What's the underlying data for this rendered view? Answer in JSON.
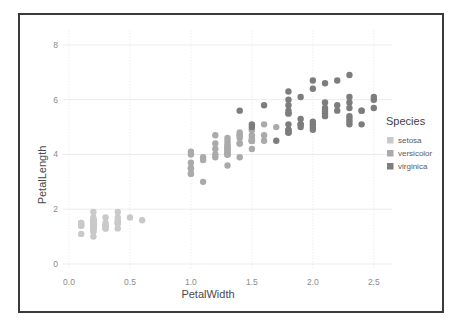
{
  "figure": {
    "frame_border_color": "#3a3a3a",
    "background": "#ffffff"
  },
  "legend": {
    "title": "Species",
    "position": "right",
    "entries": [
      {
        "label": "setosa",
        "color": "#c9c9c9"
      },
      {
        "label": "versicolor",
        "color": "#aaaaaa"
      },
      {
        "label": "virginica",
        "color": "#7d7d7d"
      }
    ]
  },
  "chart_data": {
    "type": "scatter",
    "title": "",
    "xlabel": "PetalWidth",
    "ylabel": "PetalLength",
    "xlim": [
      0.0,
      2.6
    ],
    "ylim": [
      0,
      8.4
    ],
    "xticks": [
      "0.0",
      "0.5",
      "1.0",
      "1.5",
      "2.0",
      "2.5"
    ],
    "xtick_values": [
      0.0,
      0.5,
      1.0,
      1.5,
      2.0,
      2.5
    ],
    "yticks": [
      "0",
      "2",
      "4",
      "6",
      "8"
    ],
    "ytick_values": [
      0,
      2,
      4,
      6,
      8
    ],
    "grid": true,
    "grid_axes": "both",
    "legend_title": "Species",
    "marker": "circle",
    "marker_size": 3.2,
    "series": [
      {
        "name": "setosa",
        "color": "#c9c9c9",
        "x": [
          0.2,
          0.2,
          0.2,
          0.2,
          0.2,
          0.4,
          0.3,
          0.2,
          0.2,
          0.1,
          0.2,
          0.2,
          0.1,
          0.1,
          0.2,
          0.4,
          0.4,
          0.3,
          0.3,
          0.3,
          0.2,
          0.4,
          0.2,
          0.5,
          0.2,
          0.2,
          0.4,
          0.2,
          0.2,
          0.2,
          0.2,
          0.4,
          0.1,
          0.2,
          0.2,
          0.2,
          0.2,
          0.1,
          0.2,
          0.2,
          0.3,
          0.3,
          0.2,
          0.6,
          0.4,
          0.3,
          0.2,
          0.2,
          0.2,
          0.2
        ],
        "y": [
          1.4,
          1.4,
          1.3,
          1.5,
          1.4,
          1.7,
          1.4,
          1.5,
          1.4,
          1.5,
          1.5,
          1.6,
          1.4,
          1.1,
          1.2,
          1.5,
          1.3,
          1.4,
          1.7,
          1.5,
          1.7,
          1.5,
          1.0,
          1.7,
          1.9,
          1.6,
          1.6,
          1.5,
          1.4,
          1.6,
          1.6,
          1.5,
          1.5,
          1.4,
          1.5,
          1.2,
          1.3,
          1.4,
          1.3,
          1.5,
          1.3,
          1.3,
          1.3,
          1.6,
          1.9,
          1.4,
          1.6,
          1.4,
          1.5,
          1.4
        ]
      },
      {
        "name": "versicolor",
        "color": "#aaaaaa",
        "x": [
          1.4,
          1.5,
          1.5,
          1.3,
          1.5,
          1.3,
          1.6,
          1.0,
          1.3,
          1.4,
          1.0,
          1.5,
          1.0,
          1.4,
          1.3,
          1.4,
          1.5,
          1.0,
          1.5,
          1.1,
          1.8,
          1.3,
          1.5,
          1.2,
          1.3,
          1.4,
          1.4,
          1.7,
          1.5,
          1.0,
          1.1,
          1.0,
          1.2,
          1.6,
          1.5,
          1.6,
          1.5,
          1.3,
          1.3,
          1.3,
          1.2,
          1.4,
          1.2,
          1.0,
          1.3,
          1.2,
          1.3,
          1.3,
          1.1,
          1.3
        ],
        "y": [
          4.7,
          4.5,
          4.9,
          4.0,
          4.6,
          4.5,
          4.7,
          3.3,
          4.6,
          3.9,
          3.5,
          4.2,
          4.0,
          4.7,
          3.6,
          4.4,
          4.5,
          4.1,
          4.5,
          3.9,
          4.8,
          4.0,
          4.9,
          4.7,
          4.3,
          4.4,
          4.8,
          5.0,
          4.5,
          3.5,
          3.8,
          3.7,
          3.9,
          5.1,
          4.5,
          4.5,
          4.7,
          4.4,
          4.1,
          4.0,
          4.4,
          4.6,
          4.0,
          3.3,
          4.2,
          4.2,
          4.2,
          4.3,
          3.0,
          4.1
        ]
      },
      {
        "name": "virginica",
        "color": "#7d7d7d",
        "x": [
          2.5,
          1.9,
          2.1,
          1.8,
          2.2,
          2.1,
          1.7,
          1.8,
          1.8,
          2.5,
          2.0,
          1.9,
          2.1,
          2.0,
          2.4,
          2.3,
          1.8,
          2.2,
          2.3,
          1.5,
          2.3,
          2.0,
          2.0,
          1.8,
          2.1,
          1.8,
          1.8,
          1.8,
          2.1,
          1.6,
          1.9,
          2.0,
          2.2,
          1.5,
          1.4,
          2.3,
          2.4,
          1.8,
          1.8,
          2.1,
          2.4,
          2.3,
          1.9,
          2.3,
          2.5,
          2.3,
          1.9,
          2.0,
          2.3,
          1.8
        ],
        "y": [
          6.0,
          5.1,
          5.9,
          5.6,
          5.8,
          6.6,
          4.5,
          6.3,
          5.8,
          6.1,
          5.1,
          5.3,
          5.5,
          5.0,
          5.1,
          5.3,
          5.5,
          6.7,
          6.9,
          5.0,
          5.7,
          4.9,
          6.7,
          4.9,
          5.7,
          6.0,
          4.8,
          4.9,
          5.6,
          5.8,
          6.1,
          6.4,
          5.6,
          5.1,
          5.6,
          6.1,
          5.6,
          5.5,
          4.8,
          5.4,
          5.6,
          5.1,
          5.1,
          5.9,
          5.7,
          5.2,
          5.0,
          5.2,
          5.4,
          5.1
        ]
      }
    ]
  }
}
